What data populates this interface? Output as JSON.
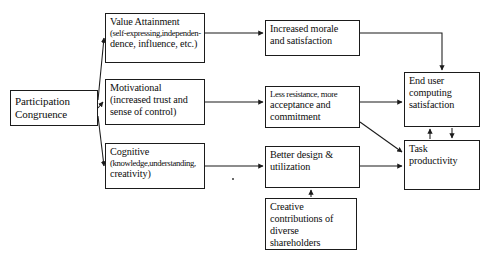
{
  "diagram": {
    "type": "flowchart",
    "stroke_color": "#1b1b1b",
    "text_color": "#0d0d0d",
    "background": "#ffffff",
    "nodes": [
      {
        "id": "participation-congruence",
        "lines": [
          "Participation",
          "Congruence"
        ],
        "x": 10,
        "y": 90,
        "w": 88,
        "h": 36,
        "size": "t11"
      },
      {
        "id": "value-attainment",
        "lines": [
          "Value Attainment",
          "(self-expressing,independen-",
          "dence, influence, etc.)"
        ],
        "x": 105,
        "y": 13,
        "w": 100,
        "h": 50,
        "size": "t10"
      },
      {
        "id": "motivational",
        "lines": [
          "Motivational",
          "(increased trust and",
          "sense of control)"
        ],
        "x": 105,
        "y": 79,
        "w": 100,
        "h": 46,
        "size": "t10"
      },
      {
        "id": "cognitive",
        "lines": [
          "Cognitive",
          "(knowledge,understanding,",
          "creativity)"
        ],
        "x": 105,
        "y": 143,
        "w": 100,
        "h": 46,
        "size": "t10"
      },
      {
        "id": "increased-morale",
        "lines": [
          "Increased morale",
          "and satisfaction"
        ],
        "x": 265,
        "y": 20,
        "w": 95,
        "h": 36,
        "size": "t10"
      },
      {
        "id": "less-resistance",
        "lines": [
          "Less resistance, more",
          "acceptance and",
          "commitment"
        ],
        "x": 265,
        "y": 86,
        "w": 95,
        "h": 42,
        "size": "t10"
      },
      {
        "id": "better-design",
        "lines": [
          "Better design &",
          "utilization"
        ],
        "x": 265,
        "y": 146,
        "w": 95,
        "h": 42,
        "size": "t10"
      },
      {
        "id": "end-user-computing-satisfaction",
        "lines": [
          "End user",
          "computing",
          "satisfaction"
        ],
        "x": 404,
        "y": 72,
        "w": 76,
        "h": 55,
        "size": "t10"
      },
      {
        "id": "task-productivity",
        "lines": [
          "Task",
          "productivity"
        ],
        "x": 404,
        "y": 140,
        "w": 76,
        "h": 50,
        "size": "t10"
      },
      {
        "id": "creative-contributions",
        "lines": [
          "Creative",
          "contributions of",
          "diverse",
          "shareholders"
        ],
        "x": 265,
        "y": 198,
        "w": 92,
        "h": 52,
        "size": "t10"
      }
    ],
    "edges": [
      {
        "id": "pc-to-value-attainment",
        "from": "participation-congruence",
        "to": "value-attainment"
      },
      {
        "id": "pc-to-motivational",
        "from": "participation-congruence",
        "to": "motivational"
      },
      {
        "id": "pc-to-cognitive",
        "from": "participation-congruence",
        "to": "cognitive"
      },
      {
        "id": "value-attainment-to-increased-morale",
        "from": "value-attainment",
        "to": "increased-morale"
      },
      {
        "id": "motivational-to-less-resistance",
        "from": "motivational",
        "to": "less-resistance"
      },
      {
        "id": "cognitive-to-better-design",
        "from": "cognitive",
        "to": "better-design"
      },
      {
        "id": "increased-morale-to-end-user",
        "from": "increased-morale",
        "to": "end-user-computing-satisfaction"
      },
      {
        "id": "less-resistance-to-end-user",
        "from": "less-resistance",
        "to": "end-user-computing-satisfaction"
      },
      {
        "id": "less-resistance-to-task-productivity",
        "from": "less-resistance",
        "to": "task-productivity"
      },
      {
        "id": "better-design-to-task-productivity",
        "from": "better-design",
        "to": "task-productivity"
      },
      {
        "id": "task-productivity-to-end-user",
        "from": "task-productivity",
        "to": "end-user-computing-satisfaction"
      },
      {
        "id": "end-user-to-task-productivity",
        "from": "end-user-computing-satisfaction",
        "to": "task-productivity"
      },
      {
        "id": "creative-contributions-to-better-design",
        "from": "creative-contributions",
        "to": "better-design"
      }
    ]
  }
}
